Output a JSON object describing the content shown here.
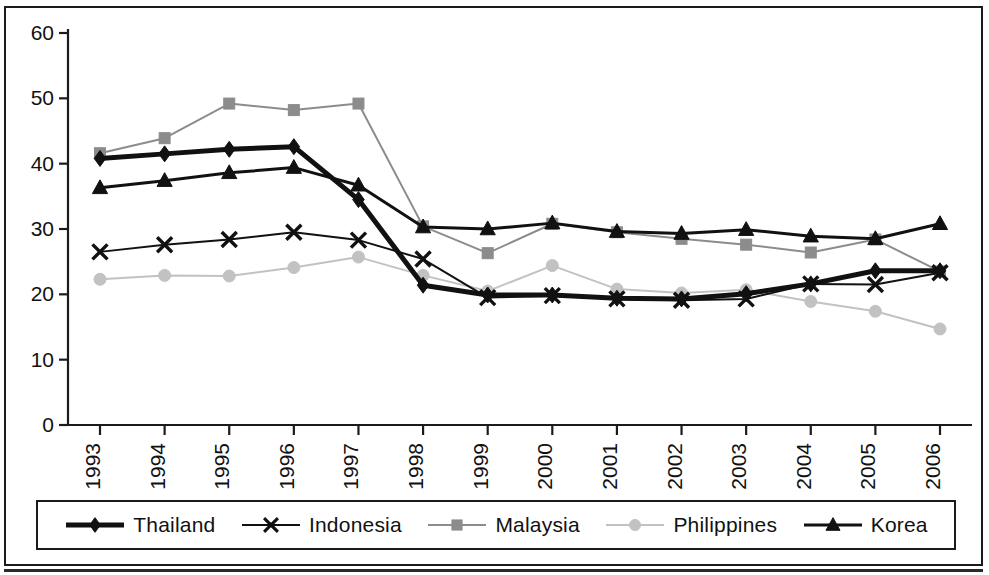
{
  "chart_data": {
    "type": "line",
    "title": "",
    "subtitle": "",
    "xlabel": "",
    "ylabel": "",
    "xlim": [
      1993,
      2006
    ],
    "ylim": [
      0,
      60
    ],
    "y_ticks": [
      0,
      10,
      20,
      30,
      40,
      50,
      60
    ],
    "grid": false,
    "legend_position": "bottom",
    "categories": [
      "1993",
      "1994",
      "1995",
      "1996",
      "1997",
      "1998",
      "1999",
      "2000",
      "2001",
      "2002",
      "2003",
      "2004",
      "2005",
      "2006"
    ],
    "series": [
      {
        "name": "Thailand",
        "marker": "diamond",
        "color": "#111111",
        "line_width": 5,
        "values": [
          40.8,
          41.5,
          42.2,
          42.6,
          34.5,
          21.4,
          19.9,
          19.9,
          19.4,
          19.3,
          20.1,
          21.6,
          23.6,
          23.6
        ]
      },
      {
        "name": "Indonesia",
        "marker": "x",
        "color": "#111111",
        "line_width": 2,
        "values": [
          26.5,
          27.6,
          28.4,
          29.5,
          28.3,
          25.4,
          19.5,
          19.8,
          19.3,
          19.1,
          19.3,
          21.6,
          21.5,
          23.3
        ]
      },
      {
        "name": "Malaysia",
        "marker": "square",
        "color": "#8c8c8c",
        "line_width": 2,
        "values": [
          41.6,
          43.9,
          49.2,
          48.2,
          49.2,
          30.4,
          26.3,
          30.8,
          29.5,
          28.5,
          27.6,
          26.4,
          28.4,
          23.5
        ]
      },
      {
        "name": "Philippines",
        "marker": "circle",
        "color": "#c2c2c2",
        "line_width": 2,
        "values": [
          22.3,
          22.9,
          22.8,
          24.1,
          25.7,
          22.9,
          20.5,
          24.4,
          20.8,
          20.2,
          20.7,
          18.9,
          17.4,
          14.7
        ]
      },
      {
        "name": "Korea",
        "marker": "triangle",
        "color": "#111111",
        "line_width": 3,
        "values": [
          36.3,
          37.4,
          38.6,
          39.4,
          36.7,
          30.3,
          30.0,
          30.9,
          29.6,
          29.3,
          29.9,
          28.9,
          28.5,
          30.8
        ]
      }
    ]
  },
  "legend": {
    "items": [
      {
        "label": "Thailand"
      },
      {
        "label": "Indonesia"
      },
      {
        "label": "Malaysia"
      },
      {
        "label": "Philippines"
      },
      {
        "label": "Korea"
      }
    ]
  }
}
